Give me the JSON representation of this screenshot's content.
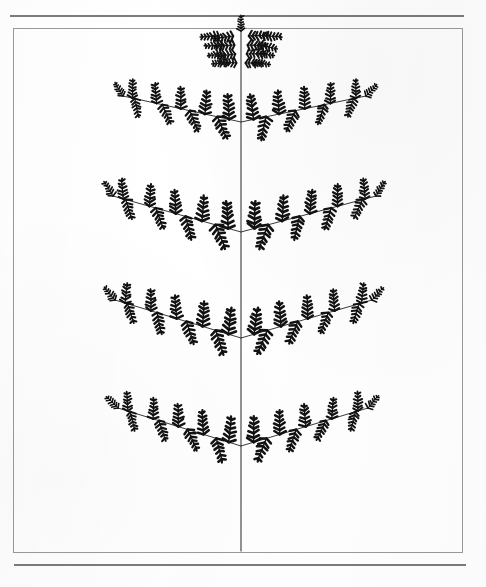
{
  "page": {
    "width": 486,
    "height": 587,
    "background_color": "#ffffff",
    "media": "scanned-document-page"
  },
  "rules": {
    "top_rule": {
      "x": 10,
      "y": 15,
      "width": 454,
      "thickness": 2,
      "color": "#7c7c7e"
    },
    "bottom_rule": {
      "x": 14,
      "y": 564,
      "width": 452,
      "thickness": 2,
      "color": "#7c7c7e"
    }
  },
  "figure_box": {
    "label": "figure-frame",
    "x": 13,
    "y": 28,
    "width": 448,
    "height": 523,
    "border_color": "#9a9a9c",
    "border_width": 1,
    "fill": "transparent"
  },
  "figure": {
    "name": "fractal-fern-leaf",
    "ink_color": "#121212",
    "stem_color": "#3a3a3a",
    "axis": {
      "name": "central-rachis",
      "x": 241,
      "y_top": 32,
      "y_bottom": 551,
      "stroke_width": 1.1
    },
    "apex": {
      "name": "apical-tip-cluster",
      "center_x": 241,
      "center_y": 56,
      "rows": 4,
      "row_span_px": [
        52,
        44,
        38,
        30
      ],
      "row_y": [
        36,
        45,
        54,
        63
      ]
    },
    "pair_count": 4,
    "pinna_pairs": [
      {
        "index": 1,
        "junction_y": 122,
        "left": {
          "tip_x": 123,
          "tip_y": 96,
          "leaflets_upper": 5,
          "leaflets_lower": 4,
          "scale": 1.0
        },
        "right": {
          "tip_x": 366,
          "tip_y": 96,
          "leaflets_upper": 5,
          "leaflets_lower": 4,
          "scale": 1.0
        }
      },
      {
        "index": 2,
        "junction_y": 232,
        "left": {
          "tip_x": 113,
          "tip_y": 196,
          "leaflets_upper": 5,
          "leaflets_lower": 4,
          "scale": 1.08
        },
        "right": {
          "tip_x": 376,
          "tip_y": 196,
          "leaflets_upper": 5,
          "leaflets_lower": 4,
          "scale": 1.08
        }
      },
      {
        "index": 3,
        "junction_y": 338,
        "left": {
          "tip_x": 115,
          "tip_y": 300,
          "leaflets_upper": 5,
          "leaflets_lower": 4,
          "scale": 1.06
        },
        "right": {
          "tip_x": 372,
          "tip_y": 300,
          "leaflets_upper": 5,
          "leaflets_lower": 4,
          "scale": 1.06
        }
      },
      {
        "index": 4,
        "junction_y": 446,
        "left": {
          "tip_x": 118,
          "tip_y": 408,
          "leaflets_upper": 5,
          "leaflets_lower": 4,
          "scale": 1.03
        },
        "right": {
          "tip_x": 368,
          "tip_y": 408,
          "leaflets_upper": 5,
          "leaflets_lower": 4,
          "scale": 1.03
        }
      }
    ],
    "leaflet": {
      "name": "pinnule-cluster",
      "pinnule_pairs": 5,
      "pinnule_length_px": 7,
      "pinnule_thickness_px": 2.6,
      "rachis_length_px": 22
    }
  },
  "chart_data": {
    "type": "scatter",
    "title": "",
    "xlabel": "",
    "ylabel": "",
    "levels": [
      "rachis",
      "pinna",
      "pinnule"
    ],
    "branch_junction_y": [
      122,
      232,
      338,
      446
    ],
    "apex_y": 56,
    "symmetry": "bilateral about x = 241",
    "grid": false,
    "legend": "none"
  }
}
